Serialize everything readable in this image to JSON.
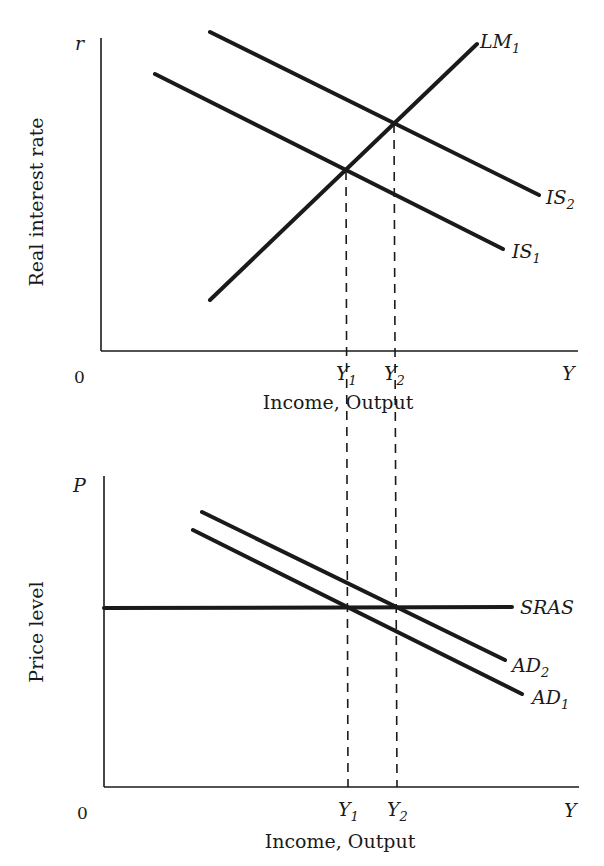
{
  "figure": {
    "colors": {
      "ink": "#1a1a1a",
      "background": "#ffffff"
    }
  },
  "chart_data": [
    {
      "type": "line",
      "title": "",
      "xlabel": "Income, Output",
      "ylabel": "Real interest rate",
      "y_axis_symbol": "r",
      "x_axis_symbol": "Y",
      "origin_label": "0",
      "x_ticks": [
        {
          "label": "Y",
          "sub": "1",
          "x": 346
        },
        {
          "label": "Y",
          "sub": "2",
          "x": 394
        }
      ],
      "series": [
        {
          "name": "LM",
          "sub": "1",
          "style": "solid",
          "points": [
            [
              210,
              300
            ],
            [
              477,
              44
            ]
          ],
          "label_pos": [
            480,
            48
          ]
        },
        {
          "name": "IS",
          "sub": "1",
          "style": "solid",
          "points": [
            [
              155,
              74
            ],
            [
              503,
              249
            ]
          ],
          "label_pos": [
            512,
            258
          ]
        },
        {
          "name": "IS",
          "sub": "2",
          "style": "solid",
          "points": [
            [
              210,
              32
            ],
            [
              539,
              195
            ]
          ],
          "label_pos": [
            546,
            204
          ]
        }
      ],
      "equilibria": [
        {
          "name": "E1",
          "x": 346,
          "y": 171
        },
        {
          "name": "E2",
          "x": 394,
          "y": 124
        }
      ],
      "axes_px": {
        "origin": [
          101,
          351
        ],
        "y_top": 38,
        "x_right": 578
      },
      "grid": false,
      "legend": "inline labels at line ends"
    },
    {
      "type": "line",
      "title": "",
      "xlabel": "Income, Output",
      "ylabel": "Price level",
      "y_axis_symbol": "P",
      "x_axis_symbol": "Y",
      "origin_label": "0",
      "x_ticks": [
        {
          "label": "Y",
          "sub": "1",
          "x": 348
        },
        {
          "label": "Y",
          "sub": "2",
          "x": 397
        }
      ],
      "series": [
        {
          "name": "SRAS",
          "sub": "",
          "style": "solid",
          "points": [
            [
              104,
              608
            ],
            [
              512,
              607
            ]
          ],
          "label_pos": [
            520,
            614
          ]
        },
        {
          "name": "AD",
          "sub": "2",
          "style": "solid",
          "points": [
            [
              202,
              512
            ],
            [
              505,
              660
            ]
          ],
          "label_pos": [
            512,
            672
          ]
        },
        {
          "name": "AD",
          "sub": "1",
          "style": "solid",
          "points": [
            [
              193,
              530
            ],
            [
              522,
              694
            ]
          ],
          "label_pos": [
            532,
            704
          ]
        }
      ],
      "equilibria": [
        {
          "name": "E1",
          "x": 348,
          "y": 608
        },
        {
          "name": "E2",
          "x": 397,
          "y": 608
        }
      ],
      "axes_px": {
        "origin": [
          104,
          787
        ],
        "y_top": 476,
        "x_right": 579
      },
      "grid": false,
      "legend": "inline labels at line ends"
    }
  ],
  "guides": [
    {
      "name": "y1-dashed-guide",
      "x1": 346,
      "y1": 171,
      "x2": 348,
      "y2": 787
    },
    {
      "name": "y2-dashed-guide",
      "x1": 394,
      "y1": 124,
      "x2": 397,
      "y2": 787
    }
  ],
  "labels": {
    "top_ylabel": "Real interest rate",
    "top_xlabel": "Income, Output",
    "top_r": "r",
    "top_Y": "Y",
    "top_zero": "0",
    "bottom_ylabel": "Price level",
    "bottom_xlabel": "Income, Output",
    "bottom_P": "P",
    "bottom_Y": "Y",
    "bottom_zero": "0"
  }
}
